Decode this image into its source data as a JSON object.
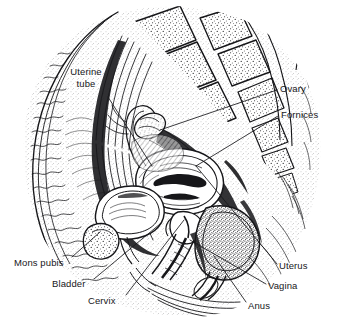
{
  "figure": {
    "kind": "anatomical-illustration",
    "style": "black-and-white pen-and-ink line drawing with stipple and cross-hatching",
    "background_color": "#ffffff",
    "ink_color": "#17171a",
    "width": 339,
    "height": 326
  },
  "labels": [
    {
      "id": "uterine-tube",
      "text_line1": "Uterine",
      "text_line2": "tube",
      "text": "Uterine tube",
      "x": 62,
      "y": 66,
      "align": "center",
      "lines": 2
    },
    {
      "id": "ovary",
      "text": "Ovary",
      "x": 280,
      "y": 83,
      "align": "left",
      "lines": 1
    },
    {
      "id": "fornices",
      "text": "Fornices",
      "x": 281,
      "y": 109,
      "align": "left",
      "lines": 1
    },
    {
      "id": "mons-pubis",
      "text": "Mons pubis",
      "x": 14,
      "y": 257,
      "align": "left",
      "lines": 1
    },
    {
      "id": "bladder",
      "text": "Bladder",
      "x": 52,
      "y": 278,
      "align": "left",
      "lines": 1
    },
    {
      "id": "cervix",
      "text": "Cervix",
      "x": 88,
      "y": 295,
      "align": "left",
      "lines": 1
    },
    {
      "id": "uterus",
      "text": "Uterus",
      "x": 279,
      "y": 260,
      "align": "left",
      "lines": 1
    },
    {
      "id": "vagina",
      "text": "Vagina",
      "x": 268,
      "y": 280,
      "align": "left",
      "lines": 1
    },
    {
      "id": "anus",
      "text": "Anus",
      "x": 248,
      "y": 300,
      "align": "left",
      "lines": 1
    }
  ],
  "leader_lines": [
    {
      "id": "leader-uterine-tube",
      "from_label": "uterine-tube",
      "x1": 108,
      "y1": 97,
      "x2": 152,
      "y2": 166
    },
    {
      "id": "leader-ovary",
      "from_label": "ovary",
      "x1": 277,
      "y1": 90,
      "x2": 160,
      "y2": 130
    },
    {
      "id": "leader-fornices",
      "from_label": "fornices",
      "x1": 278,
      "y1": 116,
      "x2": 196,
      "y2": 166
    },
    {
      "id": "leader-mons-pubis",
      "from_label": "mons-pubis",
      "x1": 72,
      "y1": 257,
      "x2": 100,
      "y2": 232
    },
    {
      "id": "leader-bladder",
      "from_label": "bladder",
      "x1": 94,
      "y1": 279,
      "x2": 160,
      "y2": 224
    },
    {
      "id": "leader-cervix",
      "from_label": "cervix",
      "x1": 126,
      "y1": 295,
      "x2": 184,
      "y2": 220
    },
    {
      "id": "leader-uterus",
      "from_label": "uterus",
      "x1": 277,
      "y1": 264,
      "x2": 196,
      "y2": 166
    },
    {
      "id": "leader-vagina",
      "from_label": "vagina",
      "x1": 266,
      "y1": 284,
      "x2": 190,
      "y2": 240
    },
    {
      "id": "leader-anus",
      "from_label": "anus",
      "x1": 246,
      "y1": 302,
      "x2": 214,
      "y2": 256
    }
  ],
  "structures": [
    {
      "id": "sacrum-vertebrae",
      "name": "Sacral vertebrae"
    },
    {
      "id": "abdominal-wall",
      "name": "Anterior abdominal wall"
    },
    {
      "id": "uterus-body",
      "name": "Body of uterus"
    },
    {
      "id": "bladder-body",
      "name": "Urinary bladder"
    },
    {
      "id": "vaginal-canal",
      "name": "Vaginal canal"
    },
    {
      "id": "rectum-anal-canal",
      "name": "Rectum and anal canal"
    },
    {
      "id": "pubic-symphysis",
      "name": "Pubic symphysis"
    },
    {
      "id": "perineum",
      "name": "Perineum"
    }
  ]
}
